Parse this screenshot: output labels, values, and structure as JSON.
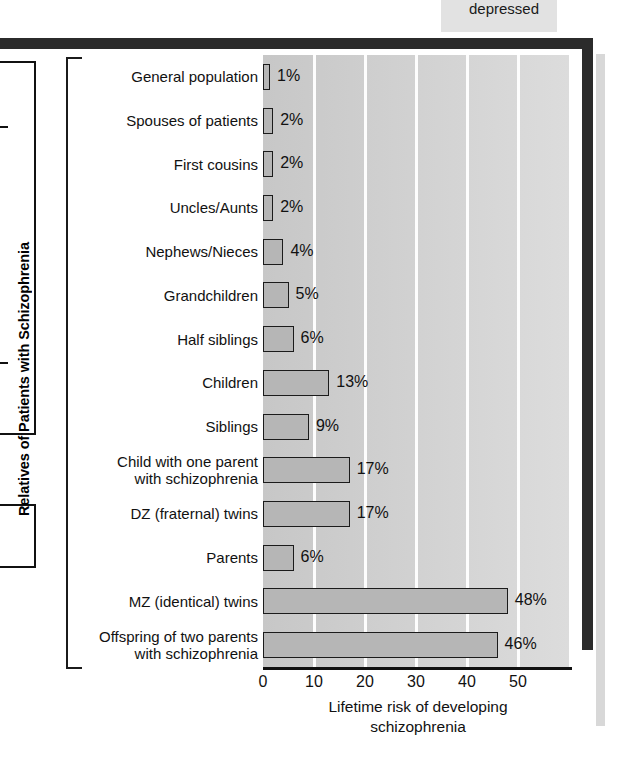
{
  "page": {
    "neighbor_caption": "depressed"
  },
  "chart_data": {
    "type": "bar",
    "orientation": "horizontal",
    "title": "",
    "ylabel": "Relatives of Patients with Schizophrenia",
    "xlabel": "Lifetime risk of developing\nschizophrenia",
    "xlim": [
      0,
      60
    ],
    "xticks": [
      0,
      10,
      20,
      30,
      40,
      50
    ],
    "xtick_labels": [
      "0",
      "10",
      "20",
      "30",
      "40",
      "50"
    ],
    "grid": "vertical-white",
    "value_suffix": "%",
    "categories": [
      "General population",
      "Spouses of patients",
      "First cousins",
      "Uncles/Aunts",
      "Nephews/Nieces",
      "Grandchildren",
      "Half siblings",
      "Children",
      "Siblings",
      "Child with one parent\nwith schizophrenia",
      "DZ (fraternal) twins",
      "Parents",
      "MZ (identical) twins",
      "Offspring of two parents\nwith schizophrenia"
    ],
    "values": [
      1,
      2,
      2,
      2,
      4,
      5,
      6,
      13,
      9,
      17,
      17,
      6,
      48,
      46
    ],
    "value_labels": [
      "1%",
      "2%",
      "2%",
      "2%",
      "4%",
      "5%",
      "6%",
      "13%",
      "9%",
      "17%",
      "17%",
      "6%",
      "48%",
      "46%"
    ],
    "colors": {
      "bar_fill": "#b6b6b6",
      "bar_stroke": "#1b1b1b",
      "plot_background": "#cdcdcd",
      "gridline": "#fdfdfd",
      "frame": "#2b2b2b",
      "text": "#111111"
    }
  }
}
